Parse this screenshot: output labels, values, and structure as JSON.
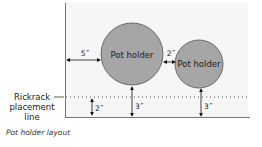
{
  "diagram": {
    "caption": "Pot holder layout",
    "rickrack_label_line1": "Rickrack",
    "rickrack_label_line2": "placement",
    "rickrack_label_line3": "line",
    "circles": [
      {
        "label": "Pot holder",
        "cx": 132,
        "cy": 54,
        "r": 31
      },
      {
        "label": "Pot holder",
        "cx": 199,
        "cy": 64,
        "r": 24
      }
    ],
    "measurements": {
      "left_margin": "5˝",
      "gap_between": "2˝",
      "line_to_edge": "2˝",
      "big_circle_to_edge": "3˝",
      "small_circle_to_edge": "3˝"
    },
    "colors": {
      "circle_fill": "#a6a6a6",
      "circle_stroke": "#555555",
      "frame": "#777777",
      "background_panel": "#f6f6f6"
    }
  }
}
